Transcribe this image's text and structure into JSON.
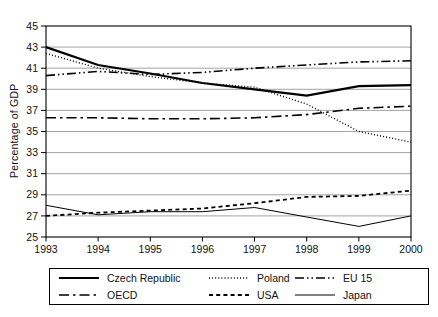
{
  "figure": {
    "background": "#ffffff",
    "text_color": "#111111"
  },
  "chart_data": {
    "type": "line",
    "title": "",
    "xlabel": "",
    "ylabel": "Percentage of GDP",
    "x": [
      1993,
      1994,
      1995,
      1996,
      1997,
      1998,
      1999,
      2000
    ],
    "xticklabels": [
      "1993",
      "1994",
      "1995",
      "1996",
      "1997",
      "1998",
      "1999",
      "2000"
    ],
    "ylim": [
      25,
      45
    ],
    "yticks": [
      25,
      27,
      29,
      31,
      33,
      35,
      37,
      39,
      41,
      43,
      45
    ],
    "grid": "horizontal",
    "grid_color": "#8c8c8c",
    "line_color": "#000000",
    "legend_position": "bottom-boxed",
    "series": [
      {
        "name": "Czech Republic",
        "line_style": "solid-thick",
        "values": [
          43.0,
          41.3,
          40.5,
          39.6,
          39.0,
          38.4,
          39.3,
          39.4
        ]
      },
      {
        "name": "Poland",
        "line_style": "dotted-fine",
        "values": [
          42.4,
          41.0,
          40.2,
          39.6,
          39.2,
          37.6,
          35.0,
          34.0
        ]
      },
      {
        "name": "EU 15",
        "line_style": "dash-dot-dot",
        "values": [
          40.3,
          40.7,
          40.4,
          40.6,
          41.0,
          41.3,
          41.6,
          41.7
        ]
      },
      {
        "name": "OECD",
        "line_style": "dash-dot",
        "values": [
          36.3,
          36.3,
          36.2,
          36.2,
          36.3,
          36.6,
          37.2,
          37.4
        ]
      },
      {
        "name": "USA",
        "line_style": "dashed",
        "values": [
          27.0,
          27.3,
          27.5,
          27.7,
          28.2,
          28.8,
          28.9,
          29.4
        ]
      },
      {
        "name": "Japan",
        "line_style": "solid-thin",
        "values": [
          28.0,
          27.1,
          27.4,
          27.4,
          27.8,
          26.9,
          26.0,
          27.0
        ]
      }
    ]
  }
}
